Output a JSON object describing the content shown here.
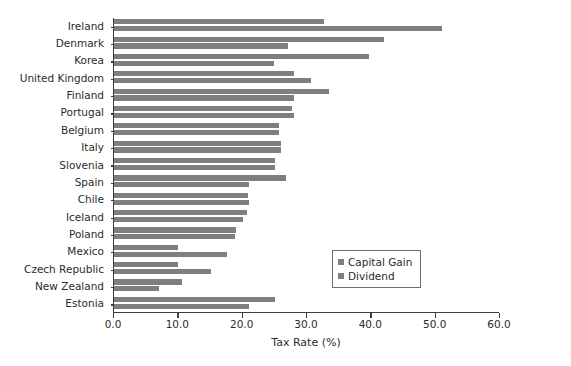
{
  "chart_data": {
    "type": "bar",
    "orientation": "horizontal",
    "title": "",
    "xlabel": "Tax Rate (%)",
    "ylabel": "",
    "xlim": [
      0.0,
      60.0
    ],
    "xticks": [
      "0.0",
      "10.0",
      "20.0",
      "30.0",
      "40.0",
      "50.0",
      "60.0"
    ],
    "xtick_values": [
      0,
      10,
      20,
      30,
      40,
      50,
      60
    ],
    "grid": false,
    "legend_position": "center-right",
    "bar_color": "#7f7f7f",
    "categories": [
      "Ireland",
      "Denmark",
      "Korea",
      "United Kingdom",
      "Finland",
      "Portugal",
      "Belgium",
      "Italy",
      "Slovenia",
      "Spain",
      "Chile",
      "Iceland",
      "Poland",
      "Mexico",
      "Czech Republic",
      "New Zealand",
      "Estonia"
    ],
    "series": [
      {
        "name": "Capital Gain",
        "color": "#7f7f7f",
        "values": [
          32.6,
          42.0,
          39.6,
          28.0,
          33.4,
          27.6,
          25.6,
          26.0,
          25.0,
          26.8,
          20.8,
          20.6,
          19.0,
          10.0,
          10.0,
          10.5,
          25.0
        ]
      },
      {
        "name": "Dividend",
        "color": "#7f7f7f",
        "values": [
          51.0,
          27.0,
          24.8,
          30.6,
          28.0,
          28.0,
          25.6,
          26.0,
          25.0,
          21.0,
          21.0,
          20.0,
          18.8,
          17.5,
          15.0,
          7.0,
          21.0
        ]
      }
    ]
  },
  "legend": {
    "items": [
      {
        "label": "Capital Gain"
      },
      {
        "label": "Dividend"
      }
    ]
  }
}
